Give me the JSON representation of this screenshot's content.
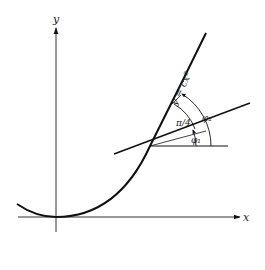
{
  "diagram": {
    "axes": {
      "x_label": "x",
      "y_label": "y"
    },
    "curve_label": "y = cx²",
    "angle_labels": {
      "pi_over_4": "π/4",
      "phi1": "φ₁",
      "phi2": "φ₂"
    },
    "colors": {
      "stroke": "#111111",
      "background": "#ffffff"
    }
  }
}
